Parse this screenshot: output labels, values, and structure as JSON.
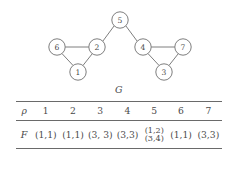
{
  "figure": {
    "caption": "G",
    "graph": {
      "nodes": [
        {
          "id": "5",
          "label": "5",
          "cx": 120,
          "cy": 20,
          "r": 8.2
        },
        {
          "id": "6",
          "label": "6",
          "cx": 57,
          "cy": 47,
          "r": 8.2
        },
        {
          "id": "2",
          "label": "2",
          "cx": 97,
          "cy": 47,
          "r": 8.2
        },
        {
          "id": "4",
          "label": "4",
          "cx": 143,
          "cy": 47,
          "r": 8.2
        },
        {
          "id": "7",
          "label": "7",
          "cx": 183,
          "cy": 47,
          "r": 8.2
        },
        {
          "id": "1",
          "label": "1",
          "cx": 78,
          "cy": 72,
          "r": 8.2
        },
        {
          "id": "3",
          "label": "3",
          "cx": 164,
          "cy": 72,
          "r": 8.2
        }
      ],
      "edges": [
        {
          "from": "5",
          "to": "2"
        },
        {
          "from": "5",
          "to": "4"
        },
        {
          "from": "6",
          "to": "2"
        },
        {
          "from": "6",
          "to": "1"
        },
        {
          "from": "2",
          "to": "1"
        },
        {
          "from": "4",
          "to": "7"
        },
        {
          "from": "4",
          "to": "3"
        },
        {
          "from": "7",
          "to": "3"
        }
      ],
      "node_stroke": "#6f6f6f",
      "node_fill": "#ffffff",
      "edge_color": "#6f6f6f"
    }
  },
  "table": {
    "row_header_symbol": "ρ",
    "columns": [
      "1",
      "2",
      "3",
      "4",
      "5",
      "6",
      "7"
    ],
    "row_label": "F",
    "values": [
      {
        "text": "(1,1)",
        "stacked": false
      },
      {
        "text": "(1,1)",
        "stacked": false
      },
      {
        "text": "(3, 3)",
        "stacked": false
      },
      {
        "text": "(3,3)",
        "stacked": false
      },
      {
        "text": "",
        "stacked": true,
        "line1": "(1,2)",
        "line2": "(3,4)"
      },
      {
        "text": "(1,1)",
        "stacked": false
      },
      {
        "text": "(3,3)",
        "stacked": false
      }
    ]
  }
}
